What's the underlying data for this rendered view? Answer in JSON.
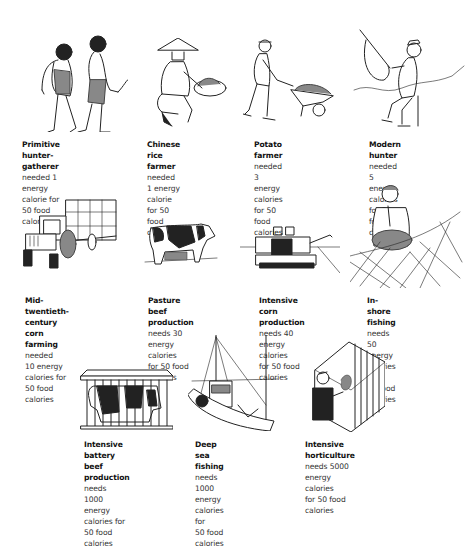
{
  "items": [
    {
      "id": "primitive-hunter-gatherer",
      "title": "Primitive hunter-gatherer",
      "rest_line1": "",
      "line2": "needed 1 energy calorie for",
      "line3": "50 food calories",
      "line4": "",
      "energy_calories": 1,
      "food_calories": 50,
      "illustration": "two-cavemen-icon"
    },
    {
      "id": "chinese-rice-farmer",
      "title": "Chinese rice farmer",
      "rest_line1": "",
      "line2": "needed 1 energy calorie",
      "line3": "for 50 food calories",
      "line4": "",
      "energy_calories": 1,
      "food_calories": 50,
      "illustration": "rice-farmer-icon"
    },
    {
      "id": "potato-farmer",
      "title": "Potato farmer",
      "rest_line1": "",
      "line2": "needed 3 energy calories",
      "line3": "for 50 food calories",
      "line4": "",
      "energy_calories": 3,
      "food_calories": 50,
      "illustration": "wheelbarrow-farmer-icon"
    },
    {
      "id": "modern-hunter",
      "title": "Modern hunter",
      "rest_line1": "",
      "line2": "needed 5 energy calories",
      "line3": "for 50 food calories",
      "line4": "",
      "energy_calories": 5,
      "food_calories": 50,
      "illustration": "bow-hunter-icon"
    },
    {
      "id": "mid-twentieth-century-corn-farming",
      "title": "Mid-twentieth-century",
      "title2": "corn farming",
      "rest_line1": " needed",
      "line2": "10 energy calories for",
      "line3": "50 food calories",
      "line4": "",
      "energy_calories": 10,
      "food_calories": 50,
      "illustration": "tractor-icon"
    },
    {
      "id": "pasture-beef-production",
      "title": "Pasture beef production",
      "rest_line1": "",
      "line2": "needs 30 energy calories",
      "line3": "for 50 food calories",
      "line4": "",
      "energy_calories": 30,
      "food_calories": 50,
      "illustration": "cow-icon"
    },
    {
      "id": "intensive-corn-production",
      "title": "Intensive corn production",
      "rest_line1": "",
      "line2": "needs 40 energy calories",
      "line3": "for 50 food calories",
      "line4": "",
      "energy_calories": 40,
      "food_calories": 50,
      "illustration": "combine-harvester-icon"
    },
    {
      "id": "in-shore-fishing",
      "title": "In-shore fishing",
      "rest_line1": " needs",
      "line2": "50 energy calories for",
      "line3": "50 food calories",
      "line4": "",
      "energy_calories": 50,
      "food_calories": 50,
      "illustration": "fisherman-net-icon"
    },
    {
      "id": "intensive-battery-beef-production",
      "title": "Intensive battery beef",
      "title2": "production",
      "rest_line1": " needs",
      "line2": "1000 energy calories for",
      "line3": "50 food calories",
      "line4": "",
      "energy_calories": 1000,
      "food_calories": 50,
      "illustration": "caged-cow-icon"
    },
    {
      "id": "deep-sea-fishing",
      "title": "Deep sea fishing",
      "rest_line1": " needs",
      "line2": "1000 energy calories for",
      "line3": "50 food calories",
      "line4": "",
      "energy_calories": 1000,
      "food_calories": 50,
      "illustration": "fishing-boat-icon"
    },
    {
      "id": "intensive-horticulture",
      "title": "Intensive horticulture",
      "rest_line1": "",
      "line2": "needs 5000 energy calories",
      "line3": "for 50 food calories",
      "line4": "",
      "energy_calories": 5000,
      "food_calories": 50,
      "illustration": "greenhouse-icon"
    }
  ],
  "colors": {
    "background": "#ffffff",
    "ink": "#222222",
    "text": "#333333"
  }
}
